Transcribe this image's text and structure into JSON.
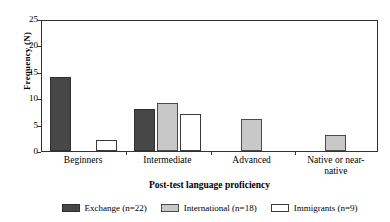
{
  "chart_data": {
    "type": "bar",
    "title": "",
    "xlabel": "Post-test language proficiency",
    "ylabel": "Frequency (N)",
    "categories": [
      "Beginners",
      "Intermediate",
      "Advanced",
      "Native or near-native"
    ],
    "category_labels_display": [
      "Beginners",
      "Intermediate",
      "Advanced",
      "Native or near-\nnative"
    ],
    "series": [
      {
        "name": "Exchange (n=22)",
        "key": "exchange",
        "color": "#474747",
        "values": [
          14,
          8,
          0,
          0
        ]
      },
      {
        "name": "International (n=18)",
        "key": "international",
        "color": "#c8c8c8",
        "values": [
          0,
          9,
          6,
          3
        ]
      },
      {
        "name": "Immigrants (n=9)",
        "key": "immigrants",
        "color": "#ffffff",
        "values": [
          2,
          7,
          0,
          0
        ]
      }
    ],
    "ylim": [
      0,
      25
    ],
    "yticks": [
      0,
      5,
      10,
      15,
      20,
      25
    ],
    "ytick_labels": [
      "0",
      "5",
      "10",
      "15",
      "20",
      "25"
    ],
    "grid": false,
    "legend_position": "bottom"
  },
  "legend": {
    "items": [
      {
        "label": "Exchange (n=22)",
        "key": "exchange"
      },
      {
        "label": "International (n=18)",
        "key": "international"
      },
      {
        "label": "Immigrants (n=9)",
        "key": "immigrants"
      }
    ]
  }
}
